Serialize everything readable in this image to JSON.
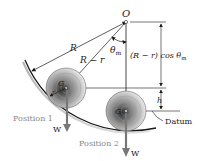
{
  "diagram": {
    "pivot_label": "O",
    "radius_label": "R",
    "radius_minus_r_label": "R − r",
    "angle_label": "θ",
    "angle_sub": "m",
    "vertical_dim_label": "(R − r) cos θ",
    "vertical_dim_sub": "m",
    "height_label": "h",
    "small_radius_label": "r",
    "center_label_1": "G",
    "center_label_2": "G",
    "weight_label_1": "W",
    "weight_label_2": "W",
    "position_1_label": "Position 1",
    "position_2_label": "Position 2",
    "datum_label": "Datum"
  },
  "colors": {
    "line": "#1a1a1a",
    "position_text": "#8a8a8a",
    "arrow_gray": "#7a7a7a",
    "disk_dark": "#3a3a3a",
    "disk_light": "#e0e0e0"
  }
}
